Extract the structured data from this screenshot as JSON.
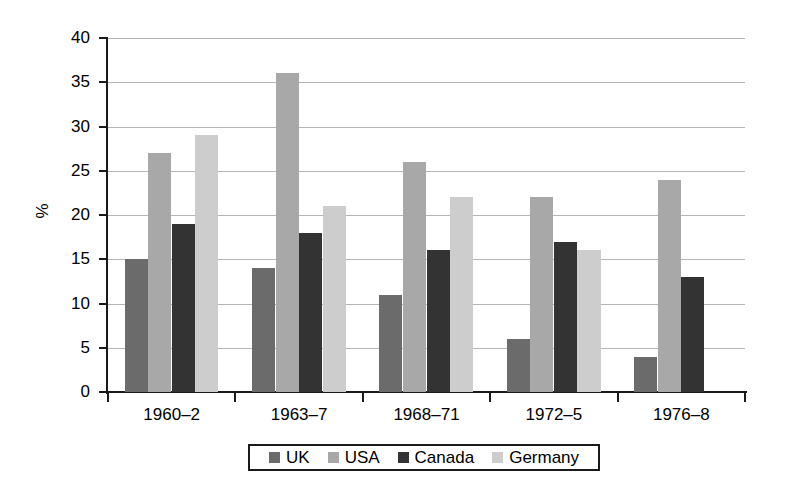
{
  "chart_data": {
    "type": "bar",
    "title": "",
    "subtitle": "",
    "xlabel": "",
    "ylabel": "%",
    "ylim": [
      0,
      40
    ],
    "ytick_step": 5,
    "yticks": [
      0,
      5,
      10,
      15,
      20,
      25,
      30,
      35,
      40
    ],
    "ytick_labels": [
      "0",
      "5",
      "10",
      "15",
      "20",
      "25",
      "30",
      "35",
      "40"
    ],
    "grid": true,
    "grid_axis": "y",
    "legend_position": "bottom",
    "categories": [
      "1960–2",
      "1963–7",
      "1968–71",
      "1972–5",
      "1976–8"
    ],
    "series": [
      {
        "name": "UK",
        "color": "#6b6b6b",
        "values": [
          15,
          14,
          11,
          6,
          4
        ]
      },
      {
        "name": "USA",
        "color": "#a8a8a8",
        "values": [
          27,
          36,
          26,
          22,
          24
        ]
      },
      {
        "name": "Canada",
        "color": "#333333",
        "values": [
          19,
          18,
          16,
          17,
          13
        ]
      },
      {
        "name": "Germany",
        "color": "#cdcdcd",
        "values": [
          29,
          21,
          22,
          16,
          null
        ]
      }
    ]
  },
  "legend": {
    "entries": [
      {
        "label": "UK",
        "color": "#6b6b6b"
      },
      {
        "label": "USA",
        "color": "#a8a8a8"
      },
      {
        "label": "Canada",
        "color": "#333333"
      },
      {
        "label": "Germany",
        "color": "#cdcdcd"
      }
    ]
  },
  "axis": {
    "y_title": "%"
  }
}
